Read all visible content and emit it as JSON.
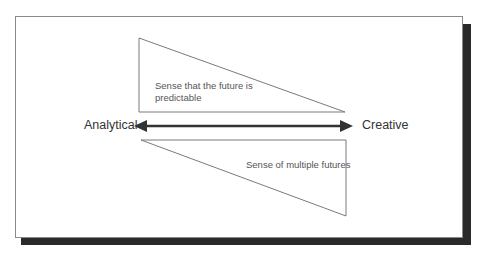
{
  "diagram": {
    "left_label": "Analytical",
    "right_label": "Creative",
    "upper_triangle_text_line1": "Sense that the future is",
    "upper_triangle_text_line2": "predictable",
    "lower_triangle_text": "Sense of multiple futures",
    "colors": {
      "frame_border": "#8a8a8a",
      "shadow": "#2a2a2a",
      "arrow": "#333333",
      "triangle_stroke": "#7a7a7a",
      "text": "#333333"
    }
  }
}
